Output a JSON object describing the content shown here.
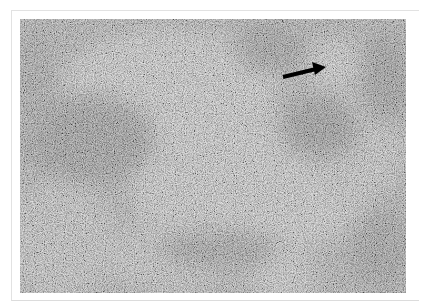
{
  "figure": {
    "annotation": {
      "type": "arrow",
      "color": "#000000",
      "points_to": "pale rounded follicle (upper right)"
    }
  }
}
